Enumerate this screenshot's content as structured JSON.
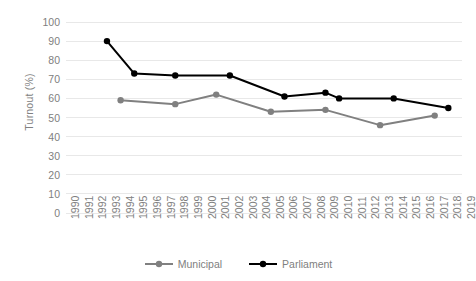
{
  "chart_data": {
    "type": "line",
    "title": "",
    "xlabel": "",
    "ylabel": "Turnout (%)",
    "ylim": [
      0,
      100
    ],
    "ytick_step": 10,
    "ytick_labels": [
      "100",
      "90",
      "80",
      "70",
      "60",
      "50",
      "40",
      "30",
      "20",
      "10",
      "0"
    ],
    "xlim": [
      1990,
      2019
    ],
    "xtick_labels": [
      "1990",
      "1991",
      "1992",
      "1993",
      "1994",
      "1995",
      "1996",
      "1997",
      "1998",
      "1999",
      "2000",
      "2001",
      "2002",
      "2003",
      "2004",
      "2005",
      "2006",
      "2007",
      "2008",
      "2009",
      "2010",
      "2011",
      "2012",
      "2013",
      "2014",
      "2015",
      "2016",
      "2017",
      "2018",
      "2019"
    ],
    "grid": true,
    "grid_axis": "y",
    "legend_position": "bottom",
    "series": [
      {
        "name": "Municipal",
        "color": "#808080",
        "x": [
          1994,
          1998,
          2001,
          2005,
          2009,
          2013,
          2017
        ],
        "values": [
          59,
          57,
          62,
          53,
          54,
          46,
          51
        ]
      },
      {
        "name": "Parliament",
        "color": "#000000",
        "x": [
          1993,
          1995,
          1998,
          2002,
          2006,
          2009,
          2010,
          2014,
          2018
        ],
        "values": [
          90,
          73,
          72,
          72,
          61,
          63,
          60,
          60,
          55
        ]
      }
    ]
  },
  "legend": {
    "items": [
      {
        "label": "Municipal",
        "color": "#808080"
      },
      {
        "label": "Parliament",
        "color": "#000000"
      }
    ]
  }
}
